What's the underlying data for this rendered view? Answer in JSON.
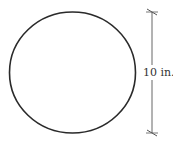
{
  "diagram": {
    "shape": "circle",
    "dimension_label": "10 in.",
    "dimension_type": "diameter",
    "colors": {
      "stroke": "#2a2a2a",
      "dimension_line": "#555555",
      "background": "#ffffff"
    }
  }
}
